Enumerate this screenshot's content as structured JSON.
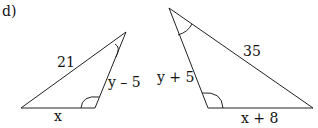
{
  "part_label": "d)",
  "triangle1": {
    "hypotenuse_label": "21",
    "side_label": "y – 5",
    "base_label": "x"
  },
  "triangle2": {
    "hypotenuse_label": "35",
    "side_label": "y + 5",
    "base_label": "x + 8"
  }
}
